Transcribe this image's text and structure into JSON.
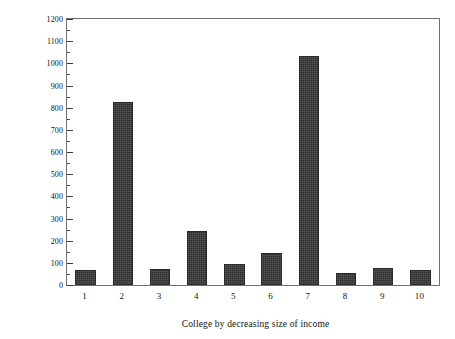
{
  "chart_data": {
    "type": "bar",
    "title": "",
    "xlabel": "College by decreasing size of income",
    "ylabel": "Pounds/Number of residents",
    "categories": [
      "1",
      "2",
      "3",
      "4",
      "5",
      "6",
      "7",
      "8",
      "9",
      "10"
    ],
    "values": [
      68,
      825,
      72,
      245,
      93,
      143,
      1035,
      53,
      78,
      67
    ],
    "ylim": [
      0,
      1200
    ],
    "ytick_labels": [
      "0",
      "100",
      "200",
      "300",
      "400",
      "500",
      "600",
      "700",
      "800",
      "900",
      "1000",
      "1100",
      "1200"
    ],
    "ytick_values": [
      0,
      100,
      200,
      300,
      400,
      500,
      600,
      700,
      800,
      900,
      1000,
      1100,
      1200
    ],
    "y_major_step": 100,
    "y_minor_step": 50,
    "grid": false,
    "legend": false,
    "bar_color": "#3c3c3c",
    "frame_color": "#6f6f6f",
    "axis_color": "#3a3a3a"
  }
}
